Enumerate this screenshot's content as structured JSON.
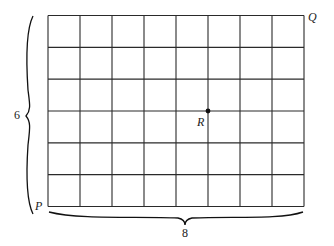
{
  "diagram": {
    "grid": {
      "columns": 8,
      "rows": 6,
      "line_color": "#2a2a2a"
    },
    "points": {
      "P": {
        "label": "P",
        "grid_x": 0,
        "grid_y": 0
      },
      "Q": {
        "label": "Q",
        "grid_x": 8,
        "grid_y": 6
      },
      "R": {
        "label": "R",
        "grid_x": 5,
        "grid_y": 3
      }
    },
    "braces": {
      "height_label": "6",
      "width_label": "8"
    }
  }
}
